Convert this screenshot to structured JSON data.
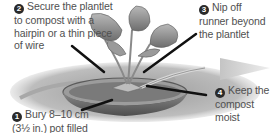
{
  "illustration": {
    "subject": "strawberry plantlet pinned into pot of compost",
    "colors": {
      "text": "#505050",
      "number_badge": "#2a2a2a",
      "pointer": "#111111",
      "arrow": "#c8c8c8"
    }
  },
  "steps": [
    {
      "number": "1",
      "text": "Bury 8–10 cm (3½ in.) pot filled"
    },
    {
      "number": "2",
      "text": "Secure the plantlet to compost with a hairpin or a thin piece of wire"
    },
    {
      "number": "3",
      "text": "Nip off runner beyond the plantlet"
    },
    {
      "number": "4",
      "text": "Keep the compost moist"
    }
  ]
}
